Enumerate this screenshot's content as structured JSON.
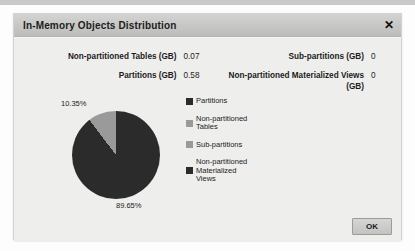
{
  "dialog": {
    "title": "In-Memory Objects Distribution",
    "close_icon": "✕",
    "ok_label": "OK"
  },
  "stats": {
    "left": [
      {
        "label": "Non-partitioned Tables (GB)",
        "value": "0.07"
      },
      {
        "label": "Partitions (GB)",
        "value": "0.58"
      }
    ],
    "right": [
      {
        "label": "Sub-partitions (GB)",
        "value": "0"
      },
      {
        "label": "Non-partitioned Materialized Views (GB)",
        "value": "0"
      }
    ]
  },
  "chart_data": {
    "type": "pie",
    "title": "In-Memory Objects Distribution",
    "categories": [
      "Partitions",
      "Non-partitioned Tables",
      "Sub-partitions",
      "Non-partitioned Materialized Views"
    ],
    "values": [
      0.58,
      0.07,
      0,
      0
    ],
    "percentages": [
      "89.65%",
      "10.35%",
      "0%",
      "0%"
    ],
    "slice_labels": {
      "large": "89.65%",
      "small": "10.35%"
    },
    "colors": [
      "#2b2b2b",
      "#9a9a9a",
      "#9a9a9a",
      "#2b2b2b"
    ],
    "legend_position": "right",
    "unit": "GB"
  },
  "legend": [
    {
      "label": "Partitions",
      "color": "#2b2b2b"
    },
    {
      "label": "Non-partitioned\nTables",
      "color": "#9a9a9a"
    },
    {
      "label": "Sub-partitions",
      "color": "#9a9a9a"
    },
    {
      "label": "Non-partitioned\nMaterialized\nViews",
      "color": "#2b2b2b"
    }
  ]
}
